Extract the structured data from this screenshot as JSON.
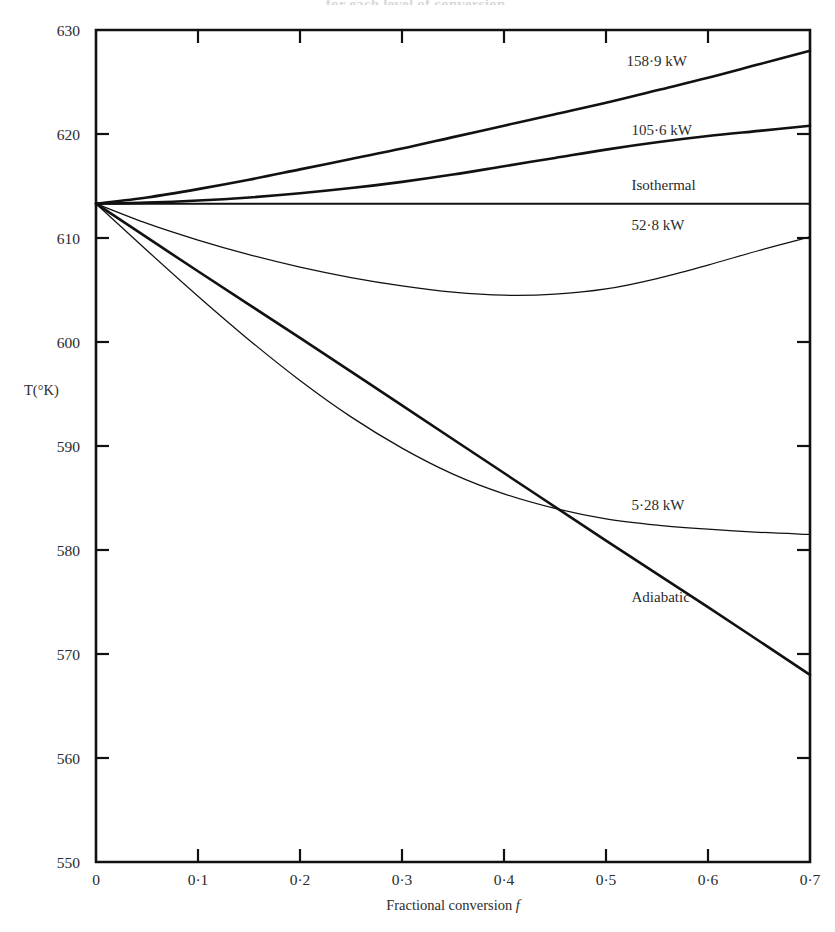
{
  "figure": {
    "cropped_caption": "for each level of conversion."
  },
  "chart_data": {
    "type": "line",
    "title": "",
    "xlabel": "Fractional conversion f",
    "ylabel": "T(°K)",
    "xlim": [
      0,
      0.7
    ],
    "ylim": [
      550,
      630
    ],
    "grid": false,
    "legend_position": "inline-right",
    "x_ticks": [
      "0",
      "0·1",
      "0·2",
      "0·3",
      "0·4",
      "0·5",
      "0·6",
      "0·7"
    ],
    "x_tick_values": [
      0,
      0.1,
      0.2,
      0.3,
      0.4,
      0.5,
      0.6,
      0.7
    ],
    "y_ticks": [
      "550",
      "560",
      "570",
      "580",
      "590",
      "600",
      "610",
      "620",
      "630"
    ],
    "y_tick_values": [
      550,
      560,
      570,
      580,
      590,
      600,
      610,
      620,
      630
    ],
    "inlet_temperature": 613.3,
    "series": [
      {
        "name": "158·9 kW",
        "label": "158·9 kW",
        "label_x": 0.52,
        "label_y": 626.5,
        "stroke": "thick",
        "x": [
          0,
          0.05,
          0.1,
          0.15,
          0.2,
          0.25,
          0.3,
          0.35,
          0.4,
          0.45,
          0.5,
          0.55,
          0.6,
          0.65,
          0.7
        ],
        "y": [
          613.3,
          613.9,
          614.7,
          615.6,
          616.6,
          617.6,
          618.6,
          619.7,
          620.8,
          621.9,
          623.0,
          624.2,
          625.4,
          626.7,
          628.0
        ]
      },
      {
        "name": "105·6 kW",
        "label": "105·6 kW",
        "label_x": 0.525,
        "label_y": 619.9,
        "stroke": "thick",
        "x": [
          0,
          0.05,
          0.1,
          0.15,
          0.2,
          0.25,
          0.3,
          0.35,
          0.4,
          0.45,
          0.5,
          0.55,
          0.6,
          0.65,
          0.7
        ],
        "y": [
          613.3,
          613.4,
          613.6,
          613.9,
          614.3,
          614.8,
          615.4,
          616.1,
          616.9,
          617.7,
          618.5,
          619.2,
          619.8,
          620.3,
          620.8
        ]
      },
      {
        "name": "Isothermal",
        "label": "Isothermal",
        "label_x": 0.525,
        "label_y": 614.6,
        "stroke": "med",
        "x": [
          0,
          0.7
        ],
        "y": [
          613.3,
          613.3
        ]
      },
      {
        "name": "52·8 kW",
        "label": "52·8 kW",
        "label_x": 0.525,
        "label_y": 610.8,
        "stroke": "thin",
        "x": [
          0,
          0.05,
          0.1,
          0.15,
          0.2,
          0.25,
          0.3,
          0.35,
          0.4,
          0.45,
          0.5,
          0.55,
          0.6,
          0.65,
          0.7
        ],
        "y": [
          613.3,
          611.4,
          609.8,
          608.4,
          607.2,
          606.2,
          605.4,
          604.8,
          604.5,
          604.6,
          605.1,
          606.1,
          607.4,
          608.8,
          610.1
        ]
      },
      {
        "name": "5·28 kW",
        "label": "5·28 kW",
        "label_x": 0.525,
        "label_y": 583.8,
        "stroke": "thin",
        "x": [
          0,
          0.05,
          0.1,
          0.15,
          0.2,
          0.25,
          0.3,
          0.35,
          0.4,
          0.45,
          0.5,
          0.55,
          0.6,
          0.65,
          0.7
        ],
        "y": [
          613.3,
          608.8,
          604.4,
          600.2,
          596.3,
          592.8,
          589.8,
          587.3,
          585.4,
          584.0,
          583.0,
          582.4,
          582.0,
          581.7,
          581.5
        ]
      },
      {
        "name": "Adiabatic",
        "label": "Adiabatic",
        "label_x": 0.525,
        "label_y": 575.0,
        "stroke": "thick",
        "x": [
          0,
          0.1,
          0.2,
          0.3,
          0.4,
          0.5,
          0.6,
          0.7
        ],
        "y": [
          613.3,
          606.8,
          600.4,
          593.9,
          587.4,
          580.9,
          574.5,
          568.0
        ]
      }
    ]
  }
}
